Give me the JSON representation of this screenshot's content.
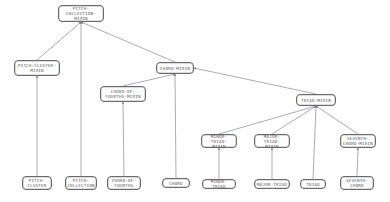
{
  "diagram": {
    "type": "class-hierarchy",
    "colors": {
      "line": "#8a8a8a",
      "box_border": "#6a6a6a",
      "text": "#555555",
      "background": "#ffffff"
    },
    "nodes": [
      {
        "id": "pitch-collection-mixin",
        "label": "PITCH-\nCOLLECTION-MIXIN",
        "x": 58,
        "y": 5,
        "w": 46,
        "h": 17
      },
      {
        "id": "pitch-cluster-mixin",
        "label": "PITCH-CLUSTER-\nMIXIN",
        "x": 14,
        "y": 60,
        "w": 46,
        "h": 16
      },
      {
        "id": "chord-mixin",
        "label": "CHORD-MIXIN",
        "x": 156,
        "y": 62,
        "w": 38,
        "h": 12
      },
      {
        "id": "chord-of-fourths-mixin",
        "label": "CHORD-OF-\nFOURTHS-MIXIN",
        "x": 100,
        "y": 86,
        "w": 46,
        "h": 16
      },
      {
        "id": "triad-mixin",
        "label": "TRIAD-MIXIN",
        "x": 296,
        "y": 94,
        "w": 40,
        "h": 12
      },
      {
        "id": "minor-triad-mixin",
        "label": "MINOR-TRIAD-\nMIXIN",
        "x": 201,
        "y": 134,
        "w": 36,
        "h": 14
      },
      {
        "id": "major-triad-mixin",
        "label": "MAJOR-TRIAD-\nMIXIN",
        "x": 254,
        "y": 134,
        "w": 36,
        "h": 14
      },
      {
        "id": "seventh-chord-mixin",
        "label": "SEVENTH-\nCHORD-MIXIN",
        "x": 340,
        "y": 134,
        "w": 36,
        "h": 14
      },
      {
        "id": "pitch-cluster",
        "label": "PITCH-\nCLUSTER",
        "x": 22,
        "y": 176,
        "w": 30,
        "h": 14
      },
      {
        "id": "pitch-collection",
        "label": "PITCH-\nCOLLECTION",
        "x": 65,
        "y": 176,
        "w": 32,
        "h": 14
      },
      {
        "id": "chord-of-fourths",
        "label": "CHORD-OF-\nFOURTHS",
        "x": 107,
        "y": 176,
        "w": 34,
        "h": 14
      },
      {
        "id": "chord",
        "label": "CHORD",
        "x": 162,
        "y": 178,
        "w": 28,
        "h": 10
      },
      {
        "id": "minor-triad",
        "label": "MINOR-TRIAD",
        "x": 202,
        "y": 179,
        "w": 34,
        "h": 10
      },
      {
        "id": "major-triad",
        "label": "MAJOR-TRIAD",
        "x": 254,
        "y": 179,
        "w": 36,
        "h": 10
      },
      {
        "id": "triad",
        "label": "TRIAD",
        "x": 300,
        "y": 179,
        "w": 26,
        "h": 10
      },
      {
        "id": "seventh-chord",
        "label": "SEVENTH-\nCHORD",
        "x": 340,
        "y": 176,
        "w": 34,
        "h": 14
      }
    ],
    "edges": [
      {
        "from": "pitch-cluster-mixin",
        "to": "pitch-collection-mixin"
      },
      {
        "from": "pitch-collection",
        "to": "pitch-collection-mixin"
      },
      {
        "from": "chord-mixin",
        "to": "pitch-collection-mixin"
      },
      {
        "from": "pitch-cluster",
        "to": "pitch-cluster-mixin"
      },
      {
        "from": "chord-of-fourths-mixin",
        "to": "chord-mixin"
      },
      {
        "from": "chord",
        "to": "chord-mixin"
      },
      {
        "from": "triad-mixin",
        "to": "chord-mixin"
      },
      {
        "from": "chord-of-fourths",
        "to": "chord-of-fourths-mixin"
      },
      {
        "from": "minor-triad-mixin",
        "to": "triad-mixin"
      },
      {
        "from": "major-triad-mixin",
        "to": "triad-mixin"
      },
      {
        "from": "triad",
        "to": "triad-mixin"
      },
      {
        "from": "seventh-chord-mixin",
        "to": "triad-mixin"
      },
      {
        "from": "minor-triad",
        "to": "minor-triad-mixin"
      },
      {
        "from": "major-triad",
        "to": "major-triad-mixin"
      },
      {
        "from": "seventh-chord",
        "to": "seventh-chord-mixin"
      }
    ]
  }
}
